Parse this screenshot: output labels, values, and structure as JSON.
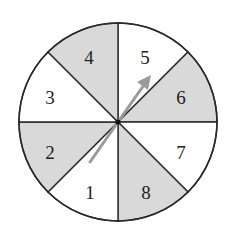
{
  "spinner": {
    "center": [
      118,
      122
    ],
    "radius": 99,
    "colors": {
      "shaded": "#d9d9d9",
      "unshaded": "#ffffff",
      "stroke": "#2a2a2a",
      "arrow": "#9a9a9a"
    },
    "sectors": [
      {
        "label": "1",
        "shaded": false
      },
      {
        "label": "2",
        "shaded": true
      },
      {
        "label": "3",
        "shaded": false
      },
      {
        "label": "4",
        "shaded": true
      },
      {
        "label": "5",
        "shaded": false
      },
      {
        "label": "6",
        "shaded": true
      },
      {
        "label": "7",
        "shaded": false
      },
      {
        "label": "8",
        "shaded": true
      }
    ],
    "arrow": {
      "from": [
        90,
        162
      ],
      "to": [
        150,
        76
      ]
    }
  }
}
